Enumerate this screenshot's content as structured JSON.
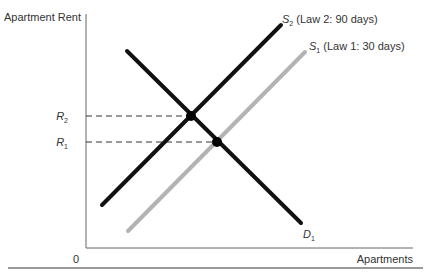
{
  "chart_data": {
    "type": "line",
    "title": "",
    "xlabel": "Apartments",
    "ylabel": "Apartment Rent",
    "origin_label": "0",
    "series": [
      {
        "name": "S2 (Law 2: 90 days)",
        "label_main": "S",
        "label_sub": "2",
        "label_rest": " (Law 2: 90 days)",
        "color": "#111111",
        "kind": "supply",
        "points": [
          [
            102,
            205
          ],
          [
            281,
            25
          ]
        ]
      },
      {
        "name": "S1 (Law 1: 30 days)",
        "label_main": "S",
        "label_sub": "1",
        "label_rest": " (Law 1: 30 days)",
        "color": "#b3b3b3",
        "kind": "supply",
        "points": [
          [
            128,
            231
          ],
          [
            305,
            52
          ]
        ]
      },
      {
        "name": "D1",
        "label_main": "D",
        "label_sub": "1",
        "label_rest": "",
        "color": "#111111",
        "kind": "demand",
        "points": [
          [
            127,
            51
          ],
          [
            301,
            223
          ]
        ]
      }
    ],
    "equilibria": [
      {
        "name": "R2",
        "label_main": "R",
        "label_sub": "2",
        "between": [
          "S2",
          "D1"
        ],
        "x": 191,
        "y": 116
      },
      {
        "name": "R1",
        "label_main": "R",
        "label_sub": "1",
        "between": [
          "S1",
          "D1"
        ],
        "x": 217,
        "y": 142
      }
    ],
    "grid": false,
    "legend": "inline labels at line ends"
  }
}
